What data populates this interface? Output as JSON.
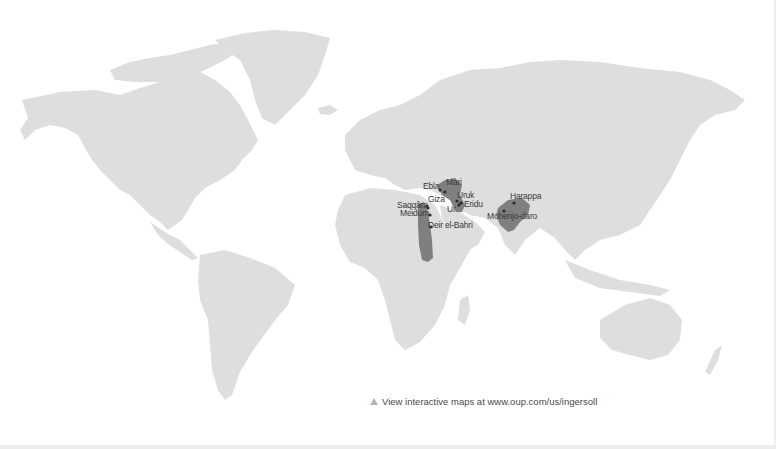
{
  "map": {
    "type": "world-map",
    "land_color": "#dedede",
    "region_color": "#7f7f7f",
    "background": "#ffffff",
    "regions": [
      {
        "name": "Nile Valley (Egypt)"
      },
      {
        "name": "Mesopotamia"
      },
      {
        "name": "Indus Valley"
      }
    ],
    "sites": [
      {
        "name": "Ebla"
      },
      {
        "name": "Mari"
      },
      {
        "name": "Uruk"
      },
      {
        "name": "Giza"
      },
      {
        "name": "Eridu"
      },
      {
        "name": "Ur"
      },
      {
        "name": "Saqqâra"
      },
      {
        "name": "Meidum"
      },
      {
        "name": "Deir el-Bahri"
      },
      {
        "name": "Harappa"
      },
      {
        "name": "Mohenjo-daro"
      }
    ]
  },
  "caption": {
    "icon": "triangle-icon",
    "text": "View interactive maps at www.oup.com/us/ingersoll"
  }
}
